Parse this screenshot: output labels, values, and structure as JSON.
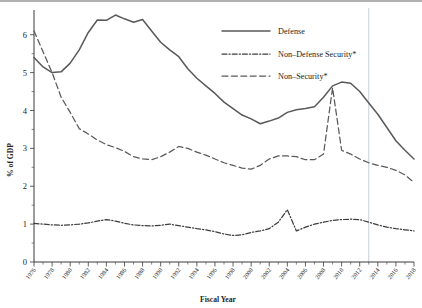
{
  "chart_data": {
    "type": "line",
    "title": "",
    "xlabel": "Fiscal Year",
    "ylabel": "% of GDP",
    "xlim": [
      1976,
      2018
    ],
    "ylim": [
      0,
      6.6
    ],
    "yticks": [
      0,
      1,
      2,
      3,
      4,
      5,
      6
    ],
    "grid": false,
    "legend_position": "top-right",
    "annotations": [
      "Vertical reference line at fiscal year 2013"
    ],
    "x": [
      1976,
      1977,
      1978,
      1979,
      1980,
      1981,
      1982,
      1983,
      1984,
      1985,
      1986,
      1987,
      1988,
      1989,
      1990,
      1991,
      1992,
      1993,
      1994,
      1995,
      1996,
      1997,
      1998,
      1999,
      2000,
      2001,
      2002,
      2003,
      2004,
      2005,
      2006,
      2007,
      2008,
      2009,
      2010,
      2011,
      2012,
      2013,
      2014,
      2015,
      2016,
      2017,
      2018
    ],
    "xticks": [
      1976,
      1978,
      1980,
      1982,
      1984,
      1986,
      1988,
      1990,
      1992,
      1994,
      1996,
      1998,
      2000,
      2002,
      2004,
      2006,
      2008,
      2010,
      2012,
      2014,
      2016,
      2018
    ],
    "xtick_labels": [
      "1976",
      "1978",
      "1980",
      "1982",
      "1984",
      "1986",
      "1988",
      "1990",
      "1992",
      "1994",
      "1996",
      "1998",
      "2000",
      "2002",
      "2004",
      "2006",
      "2008",
      "2010",
      "2012",
      "2014",
      "2016",
      "2018"
    ],
    "series": [
      {
        "name": "Defense",
        "style": "solid",
        "color": "#595959",
        "values": [
          5.4,
          5.15,
          5.0,
          5.02,
          5.25,
          5.6,
          6.06,
          6.39,
          6.38,
          6.52,
          6.42,
          6.33,
          6.4,
          6.1,
          5.8,
          5.6,
          5.42,
          5.1,
          4.85,
          4.65,
          4.45,
          4.22,
          4.05,
          3.88,
          3.78,
          3.65,
          3.72,
          3.8,
          3.95,
          4.02,
          4.05,
          4.1,
          4.35,
          4.65,
          4.75,
          4.72,
          4.5,
          4.2,
          3.9,
          3.55,
          3.2,
          2.95,
          2.72
        ]
      },
      {
        "name": "Non–Defense Security*",
        "style": "dashdot",
        "color": "#3d3d3d",
        "values": [
          1.02,
          1.0,
          0.98,
          0.97,
          0.98,
          1.0,
          1.03,
          1.08,
          1.12,
          1.08,
          1.02,
          0.98,
          0.96,
          0.95,
          0.97,
          1.0,
          0.96,
          0.92,
          0.88,
          0.85,
          0.8,
          0.74,
          0.7,
          0.72,
          0.78,
          0.82,
          0.88,
          1.05,
          1.38,
          0.82,
          0.92,
          1.0,
          1.05,
          1.1,
          1.12,
          1.13,
          1.12,
          1.05,
          0.98,
          0.92,
          0.88,
          0.85,
          0.82
        ]
      },
      {
        "name": "Non–Security*",
        "style": "dashed",
        "color": "#5a5a5a",
        "values": [
          6.1,
          5.55,
          5.0,
          4.35,
          3.95,
          3.52,
          3.38,
          3.22,
          3.1,
          3.02,
          2.92,
          2.78,
          2.72,
          2.7,
          2.78,
          2.9,
          3.05,
          3.0,
          2.9,
          2.82,
          2.72,
          2.62,
          2.55,
          2.48,
          2.45,
          2.55,
          2.72,
          2.8,
          2.8,
          2.78,
          2.7,
          2.7,
          2.85,
          4.6,
          2.95,
          2.85,
          2.72,
          2.62,
          2.55,
          2.5,
          2.42,
          2.3,
          2.1
        ]
      }
    ]
  },
  "legend": {
    "items": [
      {
        "label": "Defense"
      },
      {
        "label": "Non–Defense Security*"
      },
      {
        "label": "Non–Security*"
      }
    ]
  },
  "axes": {
    "y_title": "% of GDP",
    "x_title": "Fiscal Year",
    "y_tick_labels": [
      "0",
      "1",
      "2",
      "3",
      "4",
      "5",
      "6"
    ]
  }
}
